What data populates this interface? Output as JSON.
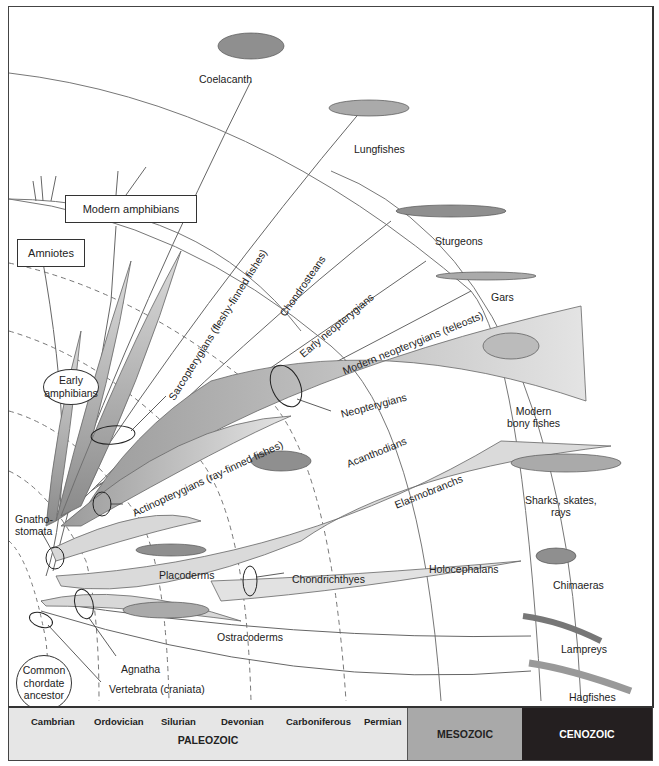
{
  "diagram": {
    "taxa_tips": [
      {
        "id": "coelacanth",
        "label": "Coelacanth"
      },
      {
        "id": "lungfishes",
        "label": "Lungfishes"
      },
      {
        "id": "sturgeons",
        "label": "Sturgeons"
      },
      {
        "id": "gars",
        "label": "Gars"
      },
      {
        "id": "modern_bony",
        "label": "Modern\nbony fishes",
        "line1": "Modern",
        "line2": "bony fishes"
      },
      {
        "id": "sharks",
        "label": "Sharks, skates, rays",
        "line1": "Sharks, skates,",
        "line2": "rays"
      },
      {
        "id": "chimaeras",
        "label": "Chimaeras"
      },
      {
        "id": "lampreys",
        "label": "Lampreys"
      },
      {
        "id": "hagfishes",
        "label": "Hagfishes"
      }
    ],
    "boxes": {
      "modern_amphibians": "Modern amphibians",
      "amniotes": "Amniotes"
    },
    "ovals": {
      "early_amphibians_l1": "Early",
      "early_amphibians_l2": "amphibians",
      "common_ancestor_l1": "Common",
      "common_ancestor_l2": "chordate",
      "common_ancestor_l3": "ancestor"
    },
    "branch_labels": {
      "sarcopterygians": "Sarcopterygians (fleshy-finned fishes)",
      "chondrosteans": "Chondrosteans",
      "early_neopterygians": "Early neopterygians",
      "modern_neopterygians": "Modern neopterygians (teleosts)",
      "neopterygians": "Neopterygians",
      "actinopterygians": "Actinopterygians (ray-finned fishes)",
      "acanthodians": "Acanthodians",
      "elasmobranchs": "Elasmobranchs",
      "gnathostomata_l1": "Gnatho-",
      "gnathostomata_l2": "stomata",
      "placoderms": "Placoderms",
      "chondrichthyes": "Chondrichthyes",
      "holocephalans": "Holocephalans",
      "ostracoderms": "Ostracoderms",
      "agnatha": "Agnatha",
      "vertebrata": "Vertebrata (craniata)"
    }
  },
  "timeline": {
    "paleozoic": {
      "label": "PALEOZOIC",
      "periods": [
        "Cambrian",
        "Ordovician",
        "Silurian",
        "Devonian",
        "Carboniferous",
        "Permian"
      ]
    },
    "mesozoic": "MESOZOIC",
    "cenozoic": "CENOZOIC"
  },
  "colors": {
    "paleozoic_bg": "#e6e6e6",
    "mesozoic_bg": "#a9a9a9",
    "cenozoic_bg": "#241f20",
    "branch_fill": "#c8c8c8",
    "line": "#555555"
  }
}
